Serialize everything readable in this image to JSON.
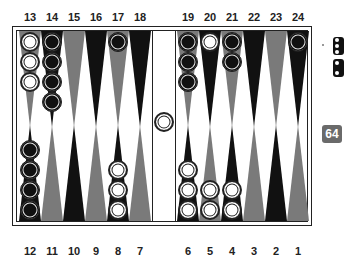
{
  "board": {
    "colors": {
      "dark_point": "#111111",
      "light_point": "#7a7a7a",
      "white_checker": "#ffffff",
      "black_checker": "#111111",
      "frame": "#222222"
    },
    "top_labels": [
      "13",
      "14",
      "15",
      "16",
      "17",
      "18",
      "19",
      "20",
      "21",
      "22",
      "23",
      "24"
    ],
    "bottom_labels": [
      "12",
      "11",
      "10",
      "9",
      "8",
      "7",
      "6",
      "5",
      "4",
      "3",
      "2",
      "1"
    ],
    "points": [
      {
        "num": 13,
        "row": "top",
        "color": "light",
        "checkers": {
          "color": "white",
          "count": 3
        }
      },
      {
        "num": 14,
        "row": "top",
        "color": "dark",
        "checkers": {
          "color": "black",
          "count": 4
        }
      },
      {
        "num": 15,
        "row": "top",
        "color": "light",
        "checkers": {
          "color": "none",
          "count": 0
        }
      },
      {
        "num": 16,
        "row": "top",
        "color": "dark",
        "checkers": {
          "color": "none",
          "count": 0
        }
      },
      {
        "num": 17,
        "row": "top",
        "color": "light",
        "checkers": {
          "color": "black",
          "count": 1
        }
      },
      {
        "num": 18,
        "row": "top",
        "color": "dark",
        "checkers": {
          "color": "none",
          "count": 0
        }
      },
      {
        "num": 19,
        "row": "top",
        "color": "light",
        "checkers": {
          "color": "black",
          "count": 3
        }
      },
      {
        "num": 20,
        "row": "top",
        "color": "dark",
        "checkers": {
          "color": "white",
          "count": 1
        }
      },
      {
        "num": 21,
        "row": "top",
        "color": "light",
        "checkers": {
          "color": "black",
          "count": 2
        }
      },
      {
        "num": 22,
        "row": "top",
        "color": "dark",
        "checkers": {
          "color": "none",
          "count": 0
        }
      },
      {
        "num": 23,
        "row": "top",
        "color": "light",
        "checkers": {
          "color": "none",
          "count": 0
        }
      },
      {
        "num": 24,
        "row": "top",
        "color": "dark",
        "checkers": {
          "color": "black",
          "count": 1
        }
      },
      {
        "num": 12,
        "row": "bottom",
        "color": "dark",
        "checkers": {
          "color": "black",
          "count": 4
        }
      },
      {
        "num": 11,
        "row": "bottom",
        "color": "light",
        "checkers": {
          "color": "none",
          "count": 0
        }
      },
      {
        "num": 10,
        "row": "bottom",
        "color": "dark",
        "checkers": {
          "color": "none",
          "count": 0
        }
      },
      {
        "num": 9,
        "row": "bottom",
        "color": "light",
        "checkers": {
          "color": "none",
          "count": 0
        }
      },
      {
        "num": 8,
        "row": "bottom",
        "color": "dark",
        "checkers": {
          "color": "white",
          "count": 3
        }
      },
      {
        "num": 7,
        "row": "bottom",
        "color": "light",
        "checkers": {
          "color": "none",
          "count": 0
        }
      },
      {
        "num": 6,
        "row": "bottom",
        "color": "dark",
        "checkers": {
          "color": "white",
          "count": 3
        }
      },
      {
        "num": 5,
        "row": "bottom",
        "color": "light",
        "checkers": {
          "color": "white",
          "count": 2
        }
      },
      {
        "num": 4,
        "row": "bottom",
        "color": "dark",
        "checkers": {
          "color": "white",
          "count": 2
        }
      },
      {
        "num": 3,
        "row": "bottom",
        "color": "light",
        "checkers": {
          "color": "none",
          "count": 0
        }
      },
      {
        "num": 2,
        "row": "bottom",
        "color": "dark",
        "checkers": {
          "color": "none",
          "count": 0
        }
      },
      {
        "num": 1,
        "row": "bottom",
        "color": "light",
        "checkers": {
          "color": "none",
          "count": 0
        }
      }
    ],
    "bar": {
      "white": 1,
      "black": 0
    }
  },
  "dice": [
    {
      "name": "die-1",
      "visible_pips": 3
    },
    {
      "name": "die-2",
      "visible_pips": 2
    }
  ],
  "doubling_cube": {
    "value": "64"
  }
}
